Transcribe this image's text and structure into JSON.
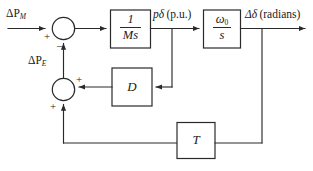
{
  "diagram": {
    "stroke_color": "#2a2a2a",
    "background": "#ffffff",
    "signals": {
      "input_mechanical": "ΔP",
      "input_mechanical_sub": "M",
      "feedback_electrical": "ΔP",
      "feedback_electrical_sub": "E",
      "mid_signal": "pδ (p.u.)",
      "mid_signal_var": "pδ",
      "mid_signal_unit": "(p.u.)",
      "output_signal": "Δδ (radians)",
      "output_signal_var": "Δδ",
      "output_signal_unit": "(radians)"
    },
    "blocks": [
      {
        "id": "inertia",
        "numerator": "1",
        "denominator": "Ms",
        "label": "1/Ms"
      },
      {
        "id": "integrator",
        "numerator": "ω",
        "numerator_sub": "0",
        "denominator": "s",
        "label": "ω0/s"
      },
      {
        "id": "damping",
        "label": "D"
      },
      {
        "id": "synchronizing",
        "label": "T"
      }
    ],
    "summing_junctions": [
      {
        "id": "sum-top",
        "left_sign": "+",
        "bottom_sign": "–"
      },
      {
        "id": "sum-bottom",
        "right_sign": "+",
        "bottom_sign": "+"
      }
    ]
  }
}
